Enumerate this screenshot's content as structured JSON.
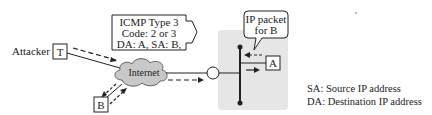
{
  "diagram": {
    "attacker_label": "Attacker",
    "attacker_node": "T",
    "victim_node": "B",
    "target_node": "A",
    "cloud_label": "Internet",
    "icmp_box": {
      "line1": "ICMP Type 3",
      "line2": "Code: 2 or 3",
      "line3": "DA: A, SA: B,"
    },
    "packet_callout": {
      "line1": "IP packet",
      "line2": "for B"
    },
    "legend": {
      "sa": "SA: Source IP address",
      "da": "DA: Destination IP address"
    },
    "colors": {
      "network_bg": "#e6e6e6",
      "cloud_fill": "#c8c8c8",
      "line": "#222222"
    }
  }
}
